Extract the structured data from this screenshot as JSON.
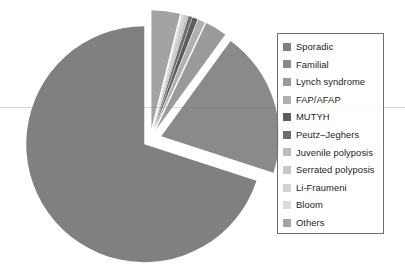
{
  "chart_data": {
    "type": "pie",
    "title": "",
    "subtitle": "",
    "xlabel": "",
    "ylabel": "",
    "grid": false,
    "legend_position": "right",
    "exploded": true,
    "start_angle_deg": 90,
    "direction": "counterclockwise",
    "categories": [
      "Sporadic",
      "Familial",
      "Lynch syndrome",
      "FAP/AFAP",
      "MUTYH",
      "Peutz–Jeghers",
      "Juvenile polyposis",
      "Serrated polyposis",
      "Li-Fraumeni",
      "Bloom",
      "Others"
    ],
    "values": [
      70.0,
      20.0,
      3.0,
      1.0,
      0.7,
      0.5,
      0.3,
      0.3,
      0.2,
      0.1,
      3.9
    ],
    "colors": [
      "#808080",
      "#8a8a8a",
      "#9a9a9a",
      "#b0b0b0",
      "#5c5c5c",
      "#6e6e6e",
      "#bcbcbc",
      "#c7c7c7",
      "#d2d2d2",
      "#dcdcdc",
      "#a3a3a3"
    ],
    "explode_offsets": [
      0.06,
      0.1,
      0.1,
      0.1,
      0.1,
      0.1,
      0.1,
      0.1,
      0.1,
      0.1,
      0.1
    ],
    "annotations": []
  },
  "legend": {
    "items": [
      {
        "label": "Sporadic",
        "color": "#808080"
      },
      {
        "label": "Familial",
        "color": "#8a8a8a"
      },
      {
        "label": "Lynch syndrome",
        "color": "#9a9a9a"
      },
      {
        "label": "FAP/AFAP",
        "color": "#b0b0b0"
      },
      {
        "label": "MUTYH",
        "color": "#5c5c5c"
      },
      {
        "label": "Peutz–Jeghers",
        "color": "#6e6e6e"
      },
      {
        "label": "Juvenile polyposis",
        "color": "#bcbcbc"
      },
      {
        "label": "Serrated polyposis",
        "color": "#c7c7c7"
      },
      {
        "label": "Li-Fraumeni",
        "color": "#d2d2d2"
      },
      {
        "label": "Bloom",
        "color": "#dcdcdc"
      },
      {
        "label": "Others",
        "color": "#a3a3a3"
      }
    ]
  },
  "canvas": {
    "background": "#ffffff",
    "pie_center_x": 150,
    "pie_center_y": 140,
    "pie_radius": 118
  }
}
